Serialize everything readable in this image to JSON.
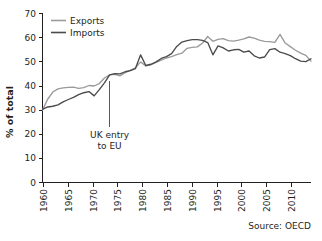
{
  "chart_data": {
    "type": "line",
    "title": "",
    "subtitle": "",
    "xlabel": "",
    "ylabel": "% of total",
    "ylim": [
      0,
      70
    ],
    "xlim": [
      1960,
      2012
    ],
    "grid": false,
    "legend_position": "top-left",
    "y_ticks": [
      "0",
      "10",
      "20",
      "30",
      "40",
      "50",
      "60",
      "70"
    ],
    "y_tick_values": [
      0,
      10,
      20,
      30,
      40,
      50,
      60,
      70
    ],
    "x_ticks": [
      "1960",
      "1965",
      "1970",
      "1975",
      "1980",
      "1985",
      "1990",
      "1995",
      "2000",
      "2005",
      "2010"
    ],
    "x_tick_values": [
      1960,
      1965,
      1970,
      1975,
      1980,
      1985,
      1990,
      1995,
      2000,
      2005,
      2010
    ],
    "x": [
      1960,
      1961,
      1962,
      1963,
      1964,
      1965,
      1966,
      1967,
      1968,
      1969,
      1970,
      1971,
      1972,
      1973,
      1974,
      1975,
      1976,
      1977,
      1978,
      1979,
      1980,
      1981,
      1982,
      1983,
      1984,
      1985,
      1986,
      1987,
      1988,
      1989,
      1990,
      1991,
      1992,
      1993,
      1994,
      1995,
      1996,
      1997,
      1998,
      1999,
      2000,
      2001,
      2002,
      2003,
      2004,
      2005,
      2006,
      2007,
      2008,
      2009,
      2010,
      2011,
      2012
    ],
    "series": [
      {
        "name": "Exports",
        "color": "#9a9a9a",
        "values": [
          30.0,
          34.5,
          37.5,
          38.8,
          39.2,
          39.4,
          39.5,
          39.0,
          39.3,
          40.2,
          40.0,
          41.0,
          43.3,
          44.6,
          44.8,
          44.2,
          45.5,
          46.5,
          47.5,
          50.0,
          48.3,
          48.8,
          49.8,
          50.7,
          51.6,
          52.2,
          53.0,
          53.6,
          55.6,
          56.0,
          56.2,
          57.8,
          60.5,
          58.5,
          59.3,
          59.6,
          58.8,
          58.6,
          59.0,
          59.5,
          60.3,
          59.8,
          59.0,
          58.5,
          58.4,
          58.1,
          61.4,
          57.8,
          56.3,
          54.8,
          53.6,
          52.7,
          50.3
        ]
      },
      {
        "name": "Imports",
        "color": "#4b4b4d",
        "values": [
          30.3,
          31.3,
          31.6,
          32.2,
          33.4,
          34.4,
          35.3,
          36.4,
          37.2,
          37.7,
          35.9,
          38.5,
          41.3,
          44.6,
          45.1,
          45.0,
          45.9,
          46.4,
          47.2,
          52.9,
          48.5,
          49.0,
          50.0,
          51.4,
          52.2,
          53.4,
          56.4,
          58.2,
          58.8,
          59.2,
          59.2,
          58.9,
          58.0,
          52.9,
          56.6,
          55.8,
          54.5,
          55.0,
          55.2,
          54.0,
          54.5,
          52.5,
          51.6,
          52.0,
          55.1,
          55.5,
          54.0,
          53.4,
          52.6,
          51.3,
          50.3,
          50.1,
          51.3
        ]
      }
    ],
    "annotations": [
      {
        "text_line1": "UK entry",
        "text_line2": "to EU",
        "x_value": 1973,
        "y_top": 44.6,
        "y_bottom": 23.0
      }
    ],
    "source": "Source: OECD"
  }
}
